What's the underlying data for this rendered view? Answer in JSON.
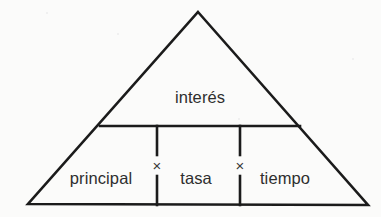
{
  "diagram": {
    "shape": "triangle",
    "stroke_color": "#1b1b1b",
    "text_color": "#2e2e2e",
    "background_color": "#fbfbfa",
    "apex_cell": {
      "label": "interés",
      "x": 200,
      "y": 97
    },
    "base_cells": [
      {
        "label": "principal",
        "x": 101,
        "y": 178
      },
      {
        "label": "tasa",
        "x": 196,
        "y": 178
      },
      {
        "label": "tiempo",
        "x": 285,
        "y": 178
      }
    ],
    "operators": [
      {
        "symbol": "×",
        "name": "multiply-operator",
        "x": 157,
        "y": 165
      },
      {
        "symbol": "×",
        "name": "multiply-operator",
        "x": 240,
        "y": 165
      }
    ],
    "geometry": {
      "apex": [
        198,
        12
      ],
      "bottom_left": [
        28,
        204
      ],
      "bottom_right": [
        368,
        205
      ],
      "divider_y": 126,
      "divider_left_x": 100,
      "divider_right_x": 300,
      "vertical_x": [
        157,
        240
      ],
      "gap_top": 155,
      "gap_bottom": 176
    }
  }
}
